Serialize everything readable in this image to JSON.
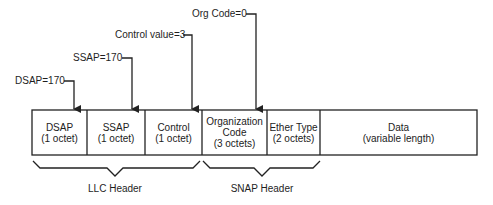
{
  "diagram": {
    "type": "frame-format",
    "annotations": [
      {
        "id": "dsap",
        "label": "DSAP=170"
      },
      {
        "id": "ssap",
        "label": "SSAP=170"
      },
      {
        "id": "control",
        "label": "Control value=3"
      },
      {
        "id": "org",
        "label": "Org Code=0"
      }
    ],
    "fields": [
      {
        "name": "DSAP",
        "size": "(1 octet)"
      },
      {
        "name": "SSAP",
        "size": "(1 octet)"
      },
      {
        "name": "Control",
        "size": "(1 octet)"
      },
      {
        "name": "Organization",
        "name2": "Code",
        "size": "(3 octets)"
      },
      {
        "name": "Ether Type",
        "size": "(2 octets)"
      },
      {
        "name": "Data",
        "size": "(variable length)"
      }
    ],
    "groups": [
      {
        "label": "LLC Header"
      },
      {
        "label": "SNAP Header"
      }
    ],
    "colors": {
      "line": "#222222",
      "background": "#ffffff"
    }
  }
}
